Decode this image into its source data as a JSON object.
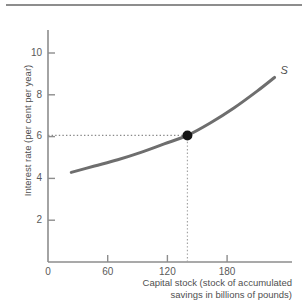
{
  "figure": {
    "has_top_rule": true,
    "background_color": "#ffffff"
  },
  "chart_data": {
    "type": "line",
    "title": "",
    "subtitle": "",
    "xlabel_line1": "Capital stock (stock of accumulated",
    "xlabel_line2": "savings in billions of pounds)",
    "ylabel": "Interest rate (per cent per year)",
    "xlim": [
      0,
      210
    ],
    "ylim": [
      0,
      11
    ],
    "xticks": [
      0,
      60,
      120,
      180
    ],
    "xtick_labels": [
      "0",
      "60",
      "120",
      "180"
    ],
    "yticks": [
      2,
      4,
      6,
      8,
      10
    ],
    "ytick_labels": [
      "2",
      "4",
      "6",
      "8",
      "10"
    ],
    "grid": false,
    "legend_position": "none",
    "series": [
      {
        "name": "S",
        "label": "S",
        "label_style": "italic",
        "color": "#6e6e6e",
        "line_width": 3,
        "x": [
          20,
          40,
          60,
          80,
          100,
          120,
          140,
          160,
          180,
          195
        ],
        "y": [
          4.25,
          4.55,
          4.85,
          5.2,
          5.6,
          6.0,
          6.6,
          7.3,
          8.1,
          8.75
        ]
      }
    ],
    "annotations": [
      {
        "name": "equilibrium-point",
        "type": "point",
        "x": 120,
        "y": 6,
        "color": "#151515",
        "radius": 5
      },
      {
        "name": "horizontal-guide",
        "type": "dotted-line",
        "from": [
          0,
          6
        ],
        "to": [
          120,
          6
        ],
        "color": "#8a8a8a"
      },
      {
        "name": "vertical-guide",
        "type": "dotted-line",
        "from": [
          120,
          0
        ],
        "to": [
          120,
          6
        ],
        "color": "#a0a0a0"
      }
    ],
    "axis_color": "#8d8d8d"
  }
}
